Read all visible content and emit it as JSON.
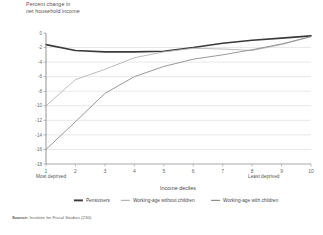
{
  "chart_data": {
    "type": "line",
    "title": "Percent change in net household income",
    "title_line1": "Percent change in",
    "title_line2": "net household income",
    "xlabel": "Income deciles",
    "ylabel": "Percent change in net household income",
    "x_left_note": "Most deprived",
    "x_right_note": "Least deprived",
    "categories": [
      1,
      2,
      3,
      4,
      5,
      6,
      7,
      8,
      9,
      10
    ],
    "xtick_labels": [
      "1",
      "2",
      "3",
      "4",
      "5",
      "6",
      "7",
      "8",
      "9",
      "10"
    ],
    "ytick_labels": [
      "0",
      "-2",
      "-4",
      "-6",
      "-8",
      "-10",
      "-12",
      "-14",
      "-16",
      "-18"
    ],
    "ytick_values": [
      0,
      -2,
      -4,
      -6,
      -8,
      -10,
      -12,
      -14,
      -16,
      -18
    ],
    "ylim": [
      -18,
      0
    ],
    "xlim": [
      1,
      10
    ],
    "grid": true,
    "legend_position": "bottom",
    "series": [
      {
        "name": "Pensioners",
        "color": "#3a3a3a",
        "width": 1.6,
        "values": [
          -1.6,
          -2.4,
          -2.6,
          -2.6,
          -2.5,
          -2.0,
          -1.4,
          -1.0,
          -0.7,
          -0.4
        ]
      },
      {
        "name": "Working-age without children",
        "color": "#b4b4b4",
        "width": 0.9,
        "values": [
          -10.0,
          -6.4,
          -5.0,
          -3.4,
          -2.6,
          -2.1,
          -2.2,
          -2.4,
          -1.6,
          -0.5
        ]
      },
      {
        "name": "Working-age with children",
        "color": "#8d8d8d",
        "width": 0.9,
        "values": [
          -16.0,
          -12.2,
          -8.3,
          -6.0,
          -4.6,
          -3.6,
          -3.0,
          -2.3,
          -1.5,
          -0.5
        ]
      }
    ]
  },
  "source": {
    "label": "Source:",
    "text": "Institute for Fiscal Studies (230)"
  }
}
